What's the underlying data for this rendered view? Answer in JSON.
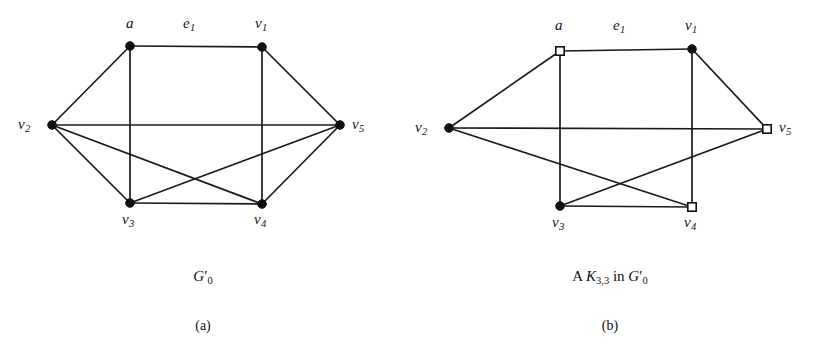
{
  "figure": {
    "panels": [
      {
        "id": "a",
        "sublabel": "(a)",
        "caption_parts": {
          "lead": "",
          "symbol": "G",
          "prime": "′",
          "sub": "0",
          "tail": ""
        },
        "caption_text": "G′0",
        "edge_label": "e",
        "edge_label_sub": "1",
        "vertices": [
          {
            "name": "a",
            "label": "a",
            "sub": "",
            "shape": "dot",
            "x": 130,
            "y": 46,
            "label_x": 126,
            "label_y": 16
          },
          {
            "name": "v1",
            "label": "v",
            "sub": "1",
            "shape": "dot",
            "x": 262,
            "y": 47,
            "label_x": 255,
            "label_y": 16
          },
          {
            "name": "v2",
            "label": "v",
            "sub": "2",
            "shape": "dot",
            "x": 52,
            "y": 125,
            "label_x": 18,
            "label_y": 117
          },
          {
            "name": "v5",
            "label": "v",
            "sub": "5",
            "shape": "dot",
            "x": 340,
            "y": 125,
            "label_x": 352,
            "label_y": 117
          },
          {
            "name": "v3",
            "label": "v",
            "sub": "3",
            "shape": "dot",
            "x": 130,
            "y": 203,
            "label_x": 122,
            "label_y": 212
          },
          {
            "name": "v4",
            "label": "v",
            "sub": "4",
            "shape": "dot",
            "x": 262,
            "y": 204,
            "label_x": 254,
            "label_y": 212
          }
        ],
        "edges": [
          [
            "a",
            "v1"
          ],
          [
            "a",
            "v2"
          ],
          [
            "a",
            "v3"
          ],
          [
            "v1",
            "v5"
          ],
          [
            "v1",
            "v4"
          ],
          [
            "v2",
            "v5"
          ],
          [
            "v2",
            "v3"
          ],
          [
            "v2",
            "v4"
          ],
          [
            "v3",
            "v4"
          ],
          [
            "v3",
            "v5"
          ],
          [
            "v4",
            "v5"
          ]
        ],
        "edge_label_pos": {
          "x": 183,
          "y": 16
        }
      },
      {
        "id": "b",
        "sublabel": "(b)",
        "caption_parts": {
          "lead": "A ",
          "symbol": "K",
          "sub": "3,3",
          "tail": " in ",
          "symbol2": "G",
          "prime": "′",
          "sub2": "0"
        },
        "caption_text": "A K3,3 in G′0",
        "edge_label": "e",
        "edge_label_sub": "1",
        "vertices": [
          {
            "name": "a",
            "label": "a",
            "sub": "",
            "shape": "square",
            "x": 153,
            "y": 51,
            "label_x": 148,
            "label_y": 18
          },
          {
            "name": "v1",
            "label": "v",
            "sub": "1",
            "shape": "dot",
            "x": 285,
            "y": 49,
            "label_x": 278,
            "label_y": 18
          },
          {
            "name": "v2",
            "label": "v",
            "sub": "2",
            "shape": "dot",
            "x": 42,
            "y": 128,
            "label_x": 8,
            "label_y": 120
          },
          {
            "name": "v5",
            "label": "v",
            "sub": "5",
            "shape": "square",
            "x": 360,
            "y": 129,
            "label_x": 372,
            "label_y": 120
          },
          {
            "name": "v3",
            "label": "v",
            "sub": "3",
            "shape": "dot",
            "x": 153,
            "y": 206,
            "label_x": 145,
            "label_y": 215
          },
          {
            "name": "v4",
            "label": "v",
            "sub": "4",
            "shape": "square",
            "x": 285,
            "y": 207,
            "label_x": 277,
            "label_y": 215
          }
        ],
        "edges": [
          [
            "a",
            "v1"
          ],
          [
            "a",
            "v2"
          ],
          [
            "a",
            "v3"
          ],
          [
            "v1",
            "v5"
          ],
          [
            "v1",
            "v4"
          ],
          [
            "v2",
            "v5"
          ],
          [
            "v2",
            "v4"
          ],
          [
            "v3",
            "v4"
          ],
          [
            "v3",
            "v5"
          ]
        ],
        "edge_label_pos": {
          "x": 206,
          "y": 18
        }
      }
    ],
    "style": {
      "line_color": "#1a1a1a",
      "vertex_fill": "#101010",
      "square_fill": "#ffffff",
      "background": "#ffffff"
    }
  }
}
